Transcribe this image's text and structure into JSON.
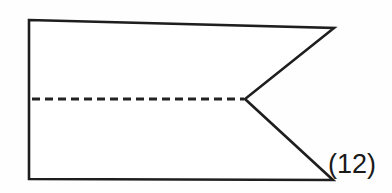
{
  "figure": {
    "caption": "(12)",
    "background_color": "#fefefe",
    "stroke_color": "#1e1e1e",
    "fill_color": "#ffffff",
    "fold_line_color": "#222222",
    "shape_name": "swallowtail-pennant-outline",
    "outline_points": "29,20 334,28 245,99 333,180 29,179",
    "fold_line": {
      "x1": 32,
      "y1": 99,
      "x2": 244,
      "y2": 99,
      "dash_pattern": "8 5",
      "style": "dashed"
    },
    "vertices": [
      {
        "name": "top-left-corner",
        "x": 29,
        "y": 20
      },
      {
        "name": "top-right-tip",
        "x": 334,
        "y": 28
      },
      {
        "name": "notch-vertex",
        "x": 245,
        "y": 99
      },
      {
        "name": "bottom-right-tip",
        "x": 333,
        "y": 180
      },
      {
        "name": "bottom-left-corner",
        "x": 29,
        "y": 179
      }
    ]
  }
}
